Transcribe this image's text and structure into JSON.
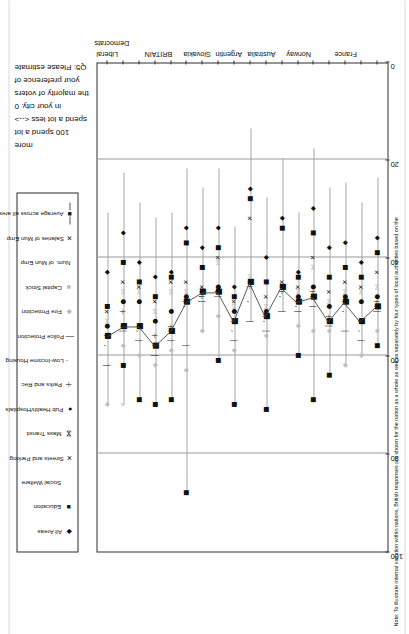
{
  "legend": {
    "items": [
      {
        "label": "All Areas",
        "marker": "diamond-marker",
        "glyph": "◆",
        "tone": "dark"
      },
      {
        "label": "Education",
        "marker": "square-marker",
        "glyph": "■",
        "tone": "dark"
      },
      {
        "label": "Social Welfare",
        "marker": "blank-marker",
        "glyph": "",
        "tone": "dark"
      },
      {
        "label": "Streets and Parking",
        "marker": "x-marker",
        "glyph": "✕",
        "tone": "dark"
      },
      {
        "label": "Mass Transit",
        "marker": "bowtie-marker",
        "glyph": "⋈",
        "tone": "dark"
      },
      {
        "label": "Pub Health/Hospitals",
        "marker": "circle-marker",
        "glyph": "●",
        "tone": "dark"
      },
      {
        "label": "Parks and Rec",
        "marker": "plus-marker",
        "glyph": "＋",
        "tone": "dark"
      },
      {
        "label": "Low-Income Housing",
        "marker": "tick-marker",
        "glyph": "ʼ",
        "tone": "dark"
      },
      {
        "label": "Police Protection",
        "marker": "bar-marker",
        "glyph": "│",
        "tone": "dark"
      },
      {
        "label": "Fire Protection",
        "marker": "light-diamond-marker",
        "glyph": "◆",
        "tone": "gray"
      },
      {
        "label": "Capital Stock",
        "marker": "light-square-marker",
        "glyph": "■",
        "tone": "gray"
      },
      {
        "label": "Num. of Mun Emp",
        "marker": "blank-marker",
        "glyph": "",
        "tone": "dark"
      },
      {
        "label": "Salaries of Mun Emp",
        "marker": "x-marker",
        "glyph": "✕",
        "tone": "dark"
      },
      {
        "label": "Average across all areas",
        "marker": "square-line-marker",
        "glyph": "■",
        "tone": "dark"
      }
    ]
  },
  "question": {
    "lines": [
      "Q5: Please estimate",
      "your preference of",
      "the majority of voters",
      "in your city.  0",
      "spend a lot less <-->",
      "100 spend a lot",
      "more"
    ]
  },
  "note": {
    "text": "Note:  To illustrate internal variation within nations, British responses are shown for the nation as a whole as well as separately by four types of local authorities based on the"
  },
  "chart_data": {
    "type": "scatter",
    "title": "",
    "xlabel": "",
    "ylabel": "",
    "ylim": [
      0,
      100
    ],
    "yticks": [
      0,
      20,
      40,
      60,
      80,
      100
    ],
    "grid": true,
    "orientation": "horizontal-rows",
    "categories": [
      "France",
      "Norway",
      "Australia",
      "Argentin",
      "Slovakia",
      "BRITAIN",
      "Liberal Democrats"
    ],
    "legend_position": "above-plot",
    "rows": [
      {
        "group": "Liberal Democrats",
        "average": 56,
        "values": [
          43,
          50,
          51,
          53,
          54,
          56,
          58,
          62,
          70
        ]
      },
      {
        "group": "Liberal Democrats",
        "average": 54,
        "values": [
          35,
          41,
          45,
          47,
          49,
          51,
          54,
          55,
          58,
          62,
          70
        ]
      },
      {
        "group": "Liberal Democrats",
        "average": 54,
        "values": [
          41,
          45,
          46,
          47,
          49,
          54,
          55,
          57,
          60,
          69
        ]
      },
      {
        "group": "BRITAIN",
        "average": 58,
        "values": [
          44,
          48,
          49,
          51,
          53,
          56,
          58,
          60,
          62,
          70
        ]
      },
      {
        "group": "BRITAIN",
        "average": 55,
        "values": [
          43,
          44,
          45,
          47,
          51,
          54,
          55,
          57,
          59,
          69
        ]
      },
      {
        "group": "BRITAIN",
        "average": 49,
        "values": [
          34,
          37,
          45,
          47,
          48,
          49,
          50,
          58,
          63,
          88
        ]
      },
      {
        "group": "Slovakia",
        "average": 47,
        "values": [
          38,
          42,
          46,
          47,
          47,
          48,
          48,
          49,
          55
        ]
      },
      {
        "group": "Slovakia",
        "average": 47,
        "values": [
          34,
          38,
          40,
          41,
          46,
          47,
          47,
          48,
          52,
          61
        ]
      },
      {
        "group": "Argentin",
        "average": 53,
        "values": [
          46,
          48,
          49,
          50,
          51,
          53,
          55,
          57,
          59,
          70
        ]
      },
      {
        "group": "Argentin",
        "average": 45,
        "values": [
          26,
          28,
          32,
          44,
          45,
          46,
          49,
          53
        ]
      },
      {
        "group": "Australia",
        "average": 52,
        "values": [
          40,
          45,
          48,
          50,
          51,
          52,
          53,
          55,
          56,
          71
        ]
      },
      {
        "group": "Australia",
        "average": 46,
        "values": [
          32,
          34,
          45,
          46,
          46,
          47,
          48,
          51
        ]
      },
      {
        "group": "Norway",
        "average": 49,
        "values": [
          43,
          44,
          46,
          47,
          48,
          49,
          50,
          51,
          54,
          60
        ]
      },
      {
        "group": "Norway",
        "average": 48,
        "values": [
          30,
          35,
          40,
          42,
          46,
          47,
          48,
          50,
          55,
          69
        ]
      },
      {
        "group": "Norway",
        "average": 53,
        "values": [
          38,
          44,
          47,
          49,
          50,
          52,
          53,
          54,
          55,
          64
        ]
      },
      {
        "group": "France",
        "average": 49,
        "values": [
          37,
          42,
          45,
          47,
          48,
          49,
          51,
          55,
          62
        ]
      },
      {
        "group": "France",
        "average": 53,
        "values": [
          41,
          44,
          46,
          47,
          49,
          53,
          55,
          57,
          60
        ]
      },
      {
        "group": "France",
        "average": 50,
        "values": [
          36,
          39,
          43,
          46,
          48,
          49,
          50,
          51,
          55,
          58
        ]
      }
    ]
  }
}
